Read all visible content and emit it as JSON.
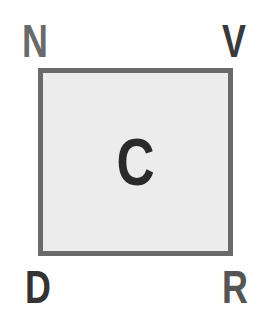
{
  "labels": {
    "top_left": "N",
    "top_right": "V",
    "bottom_left": "D",
    "bottom_right": "R",
    "center": "C"
  },
  "colors": {
    "top_left": "#6a6a6a",
    "top_right": "#3a3a3a",
    "bottom_left": "#333333",
    "bottom_right": "#555555",
    "center": "#2a2a2a",
    "box_fill": "#ececec",
    "box_border": "#6a6a6a"
  }
}
